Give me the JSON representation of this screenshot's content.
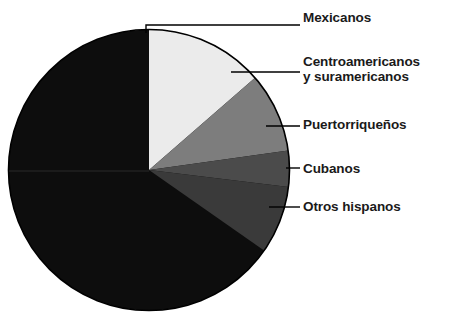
{
  "chart_data": {
    "type": "pie",
    "title": "",
    "subtitle": "",
    "xlabel": "",
    "ylabel": "",
    "legend_position": "right-with-leader-lines",
    "grid": false,
    "categories": [
      "Mexicanos",
      "Centroamericanos y suramericanos",
      "Puertorriqueños",
      "Cubanos",
      "Otros hispanos"
    ],
    "values": [
      13.6,
      9.2,
      4.2,
      7.8,
      65.2
    ],
    "slices": [
      {
        "label": "Mexicanos",
        "value": 13.6,
        "color": "#ebebeb",
        "start_angle_deg": 0,
        "end_angle_deg": 49
      },
      {
        "label": "Centroamericanos y suramericanos",
        "value": 9.2,
        "color": "#7d7d7d",
        "start_angle_deg": 49,
        "end_angle_deg": 82
      },
      {
        "label": "Puertorriqueños",
        "value": 4.2,
        "color": "#4b4b4b",
        "start_angle_deg": 82,
        "end_angle_deg": 97
      },
      {
        "label": "Cubanos",
        "value": 7.8,
        "color": "#3a3a3a",
        "start_angle_deg": 97,
        "end_angle_deg": 125
      },
      {
        "label": "Otros hispanos",
        "value": 65.2,
        "color": "#0d0d0d",
        "start_angle_deg": 125,
        "end_angle_deg": 360
      }
    ]
  },
  "legend": {
    "items": [
      {
        "label": "Mexicanos"
      },
      {
        "label": "Centroamericanos\ny suramericanos"
      },
      {
        "label": "Puertorriqueños"
      },
      {
        "label": "Cubanos"
      },
      {
        "label": "Otros hispanos"
      }
    ]
  },
  "style": {
    "outline_color": "#000000",
    "leader_color": "#000000",
    "background": "#ffffff"
  }
}
